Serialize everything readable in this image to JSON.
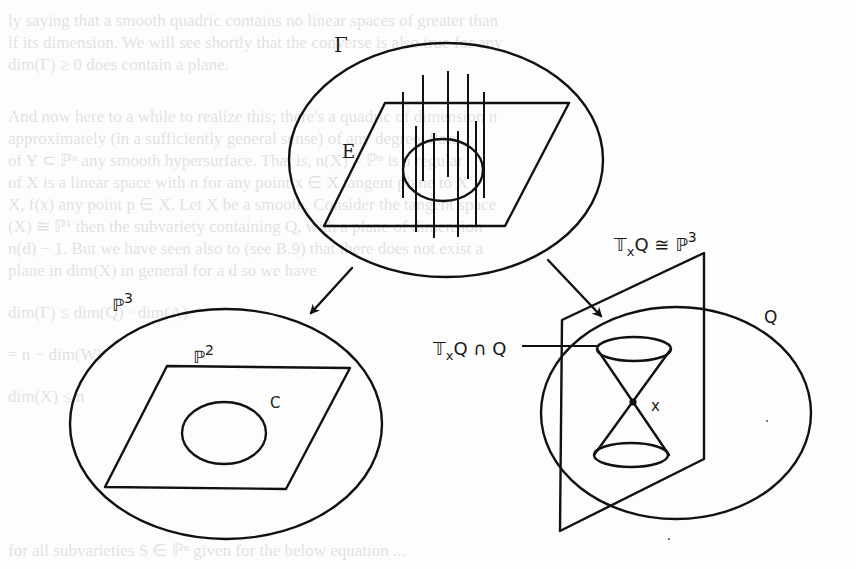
{
  "figure": {
    "type": "geometric-diagram",
    "top_panel": {
      "outer_label": "Γ",
      "plane_label": "E"
    },
    "left_panel": {
      "space_label": "ℙ",
      "space_exp": "3",
      "plane_label": "ℙ",
      "plane_exp": "2",
      "curve_label": "C"
    },
    "right_panel": {
      "tangent_label_T": "𝕋",
      "tangent_label_sub": "x",
      "tangent_label_rest": "Q ≅ ℙ",
      "tangent_label_exp": "3",
      "intersection_label_T": "𝕋",
      "intersection_label_sub": "x",
      "intersection_label_rest": "Q ∩ Q",
      "quadric_label": "Q",
      "point_label": "x"
    }
  },
  "background_bleed_text": [
    "ly saying that a smooth quadric contains no linear spaces of greater than",
    "lf its dimension. We will see shortly that the converse is also true for any",
    "dim(Γ) ≥ 0 does contain a plane.",
    "",
    "And now here to a while to realize this; there's a quadric of dimension n",
    "approximately (in a sufficiently general sense) of any degree. Pass",
    "of Y ⊂ ℙⁿ any smooth hypersurface. That is, n(X) ≠ ℙⁿ is a regular",
    "of X is a linear space with n for any point x ∈ X tangent plane to X",
    "X, f(x) any point p ∈ X. Let X be a smooth. Consider the tangent space",
    "(X) ≅ ℙ¹ then the subvariety containing Q, with a plane of dimension",
    "n(d) − 1. But we have seen also to (see B.9) that there does not exist a",
    "plane in dim(X) in general for a d so we have",
    "",
    "                  dim(Γ) ≤ dim(Q) · dim(A)",
    "",
    "                            = n − dim(W)",
    "",
    "                               dim(X) ≤ n",
    "",
    "      for all subvarieties S ∈ ℙⁿ given for the below equation ..."
  ]
}
